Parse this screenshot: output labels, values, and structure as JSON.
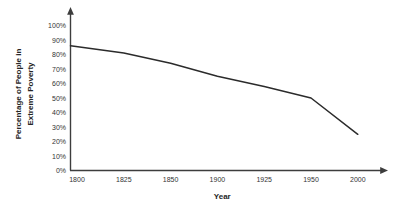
{
  "chart_data": {
    "type": "line",
    "x_categories": [
      "1800",
      "1825",
      "1850",
      "1900",
      "1925",
      "1950",
      "2000"
    ],
    "series": [
      {
        "name": "Percentage of People in Extreme Poverty",
        "values": [
          86,
          81,
          74,
          65,
          58,
          50,
          25
        ]
      }
    ],
    "title": "",
    "xlabel": "Year",
    "ylabel": "Percentage of People in Extreme Poverty",
    "ylabel_lines": [
      "Percentage of People in",
      "Extreme Poverty"
    ],
    "y_ticks": [
      "0%",
      "10%",
      "20%",
      "30%",
      "40%",
      "50%",
      "60%",
      "70%",
      "80%",
      "90%",
      "100%"
    ],
    "ylim": [
      0,
      100
    ],
    "grid": false,
    "legend": "none",
    "axes_have_arrows": true,
    "line_color": "#2b2b2b",
    "axis_color": "#3d3d3d",
    "tick_text_color": "#333333",
    "title_text_color": "#262626",
    "background": "#ffffff"
  }
}
